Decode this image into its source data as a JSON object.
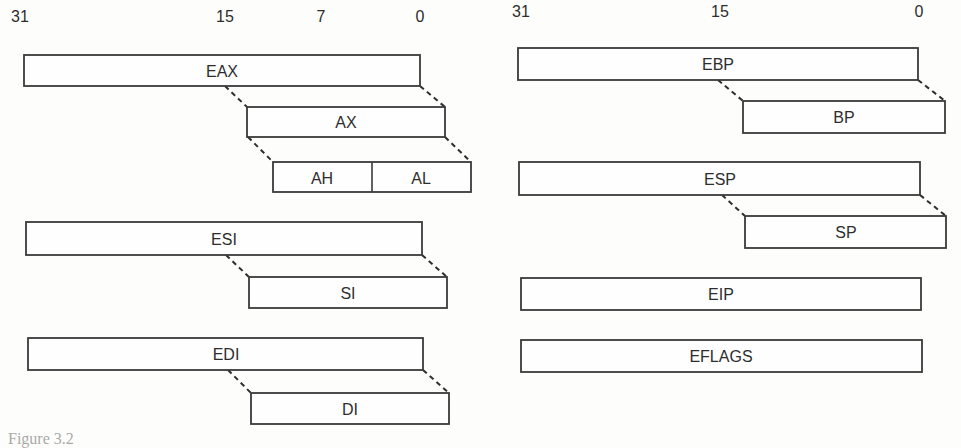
{
  "diagram": {
    "type": "register-layout",
    "left_bit_labels": [
      "31",
      "15",
      "7",
      "0"
    ],
    "right_bit_labels": [
      "31",
      "15",
      "0"
    ],
    "registers": {
      "eax": "EAX",
      "ax": "AX",
      "ah": "AH",
      "al": "AL",
      "esi": "ESI",
      "si": "SI",
      "edi": "EDI",
      "di": "DI",
      "ebp": "EBP",
      "bp": "BP",
      "esp": "ESP",
      "sp": "SP",
      "eip": "EIP",
      "eflags": "EFLAGS"
    },
    "caption_fragment": "Figure 3.2"
  }
}
